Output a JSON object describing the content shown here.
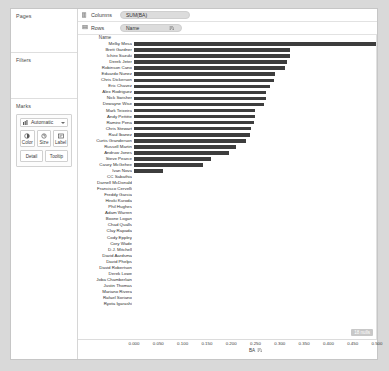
{
  "panels": {
    "pages_title": "Pages",
    "filters_title": "Filters",
    "marks_title": "Marks"
  },
  "marks": {
    "type_label": "Automatic",
    "type_icon": "bar-chart-icon",
    "buttons": [
      {
        "label": "Color",
        "icon": "color-icon"
      },
      {
        "label": "Size",
        "icon": "size-icon"
      },
      {
        "label": "Label",
        "icon": "label-icon"
      }
    ],
    "buttons2": [
      {
        "label": "Detail",
        "icon": "detail-icon"
      },
      {
        "label": "Tooltip",
        "icon": "tooltip-icon"
      }
    ]
  },
  "shelves": {
    "columns_label": "Columns",
    "columns_pill": "SUM(BA)",
    "rows_label": "Rows",
    "rows_pill": "Name",
    "rows_sort_icon": "sort-descending-icon"
  },
  "view": {
    "row_header": "Name",
    "nulls_badge": "18 nulls",
    "axis": {
      "title": "BA",
      "sort_icon": "sort-descending-icon",
      "ticks": [
        "0.000",
        "0.050",
        "0.100",
        "0.150",
        "0.200",
        "0.250",
        "0.300",
        "0.350",
        "0.400",
        "0.450",
        "0.500"
      ],
      "min": 0.0,
      "max": 0.5
    }
  },
  "chart_data": {
    "type": "bar",
    "title": "",
    "xlabel": "BA",
    "ylabel": "Name",
    "xlim": [
      0.0,
      0.5
    ],
    "grid": false,
    "legend": null,
    "orientation": "horizontal",
    "categories": [
      "Melky Mesa",
      "Brett Gardner",
      "Ichiro Suzuki",
      "Derek Jeter",
      "Robinson Cano",
      "Eduardo Nunez",
      "Chris Dickerson",
      "Eric Chavez",
      "Alex Rodriguez",
      "Nick Swisher",
      "Dewayne Wise",
      "Mark Teixeira",
      "Andy Pettitte",
      "Ramiro Pena",
      "Chris Stewart",
      "Raul Ibanez",
      "Curtis Granderson",
      "Russell Martin",
      "Andruw Jones",
      "Steve Pearce",
      "Casey McGehee",
      "Ivan Nova",
      "CC Sabathia",
      "Darnell McDonald",
      "Francisco Cervelli",
      "Freddy Garcia",
      "Hiroki Kuroda",
      "Phil Hughes",
      "Adam Warren",
      "Boone Logan",
      "Chad Qualls",
      "Clay Rapada",
      "Cody Eppley",
      "Cory Wade",
      "D.J. Mitchell",
      "David Aardsma",
      "David Phelps",
      "David Robertson",
      "Derek Lowe",
      "Joba Chamberlain",
      "Justin Thomas",
      "Mariano Rivera",
      "Rafael Soriano",
      "Ryota Igarashi"
    ],
    "values": [
      0.5,
      0.323,
      0.322,
      0.316,
      0.313,
      0.292,
      0.29,
      0.281,
      0.272,
      0.272,
      0.268,
      0.251,
      0.25,
      0.247,
      0.241,
      0.24,
      0.232,
      0.211,
      0.197,
      0.16,
      0.143,
      0.059,
      0.0,
      0.0,
      0.0,
      0.0,
      0.0,
      0.0,
      0.0,
      0.0,
      0.0,
      0.0,
      0.0,
      0.0,
      0.0,
      0.0,
      0.0,
      0.0,
      0.0,
      0.0,
      0.0,
      0.0,
      0.0,
      0.0
    ]
  }
}
